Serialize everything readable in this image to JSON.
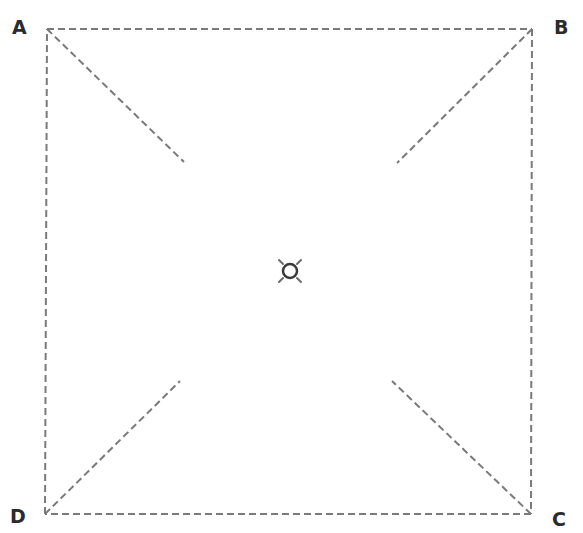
{
  "diagram": {
    "type": "square-with-diagonals",
    "line_color": "#7a7a7a",
    "label_color": "#2b2b2b",
    "dash_pattern": "7,4",
    "corners": [
      {
        "id": "A",
        "label": "A",
        "x": 47,
        "y": 29
      },
      {
        "id": "B",
        "label": "B",
        "x": 532,
        "y": 29
      },
      {
        "id": "C",
        "label": "C",
        "x": 531,
        "y": 514
      },
      {
        "id": "D",
        "label": "D",
        "x": 45,
        "y": 514
      }
    ],
    "diagonal_segments": [
      {
        "from": "A",
        "x1": 47,
        "y1": 29,
        "x2": 184,
        "y2": 162
      },
      {
        "from": "B",
        "x1": 532,
        "y1": 29,
        "x2": 397,
        "y2": 163
      },
      {
        "from": "C",
        "x1": 531,
        "y1": 514,
        "x2": 392,
        "y2": 381
      },
      {
        "from": "D",
        "x1": 45,
        "y1": 514,
        "x2": 180,
        "y2": 381
      }
    ],
    "center_marker": {
      "icon": "sun-symbol-icon",
      "cx": 290,
      "cy": 271,
      "radius": 7
    }
  }
}
